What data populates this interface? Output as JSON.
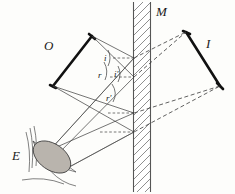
{
  "figure": {
    "kind": "optics-ray-diagram",
    "title_visible": false,
    "background_color": "#fdfdfb",
    "ink_color": "#1a1a1a"
  },
  "labels": {
    "object": "O",
    "mirror": "M",
    "image": "I",
    "eye": "E",
    "angle_incidence_1": "i",
    "angle_reflection_1": "r",
    "angle_incidence_2": "i'",
    "angle_reflection_2": "r'"
  },
  "elements": {
    "object_name": "object-arrow",
    "mirror_name": "plane-mirror",
    "image_name": "virtual-image-arrow",
    "eye_name": "observer-eye",
    "rays_name": "light-rays",
    "construction_name": "virtual-construction-lines",
    "normals_name": "mirror-normals"
  },
  "geometry": {
    "mirror_x_left": 133,
    "mirror_x_right": 151,
    "mirror_top": 2,
    "mirror_bottom": 192,
    "object_apex": [
      92,
      36
    ],
    "object_base": [
      53,
      86
    ],
    "image_apex": [
      186,
      32
    ],
    "image_base": [
      220,
      86
    ],
    "eye_center": [
      50,
      156
    ]
  },
  "colors": {
    "ink": "#1a1a1a",
    "ray": "#3a3a3a",
    "hatch": "#6a6a6a",
    "iris_fill": "#b9b4ad"
  }
}
